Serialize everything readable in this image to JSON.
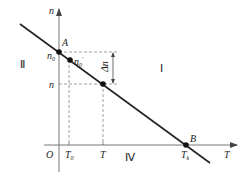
{
  "diagram": {
    "axes": {
      "y_label": "n",
      "x_label": "T",
      "origin_label": "O"
    },
    "points": {
      "A": "A",
      "B": "B"
    },
    "y_ticks": {
      "n0": "n",
      "n0_sub": "0",
      "n0_prime": "n",
      "n0_prime_sub": "0",
      "n0_prime_sup": "′",
      "n": "n"
    },
    "x_ticks": {
      "T0": "T",
      "T0_sub": "0",
      "T": "T",
      "Tk": "T",
      "Tk_sub": "k"
    },
    "delta": "Δn",
    "regions": {
      "I": "Ⅰ",
      "II": "Ⅱ",
      "IV": "Ⅳ"
    },
    "colors": {
      "line": "#222222",
      "axis": "#777777",
      "dashed": "#888888"
    }
  }
}
